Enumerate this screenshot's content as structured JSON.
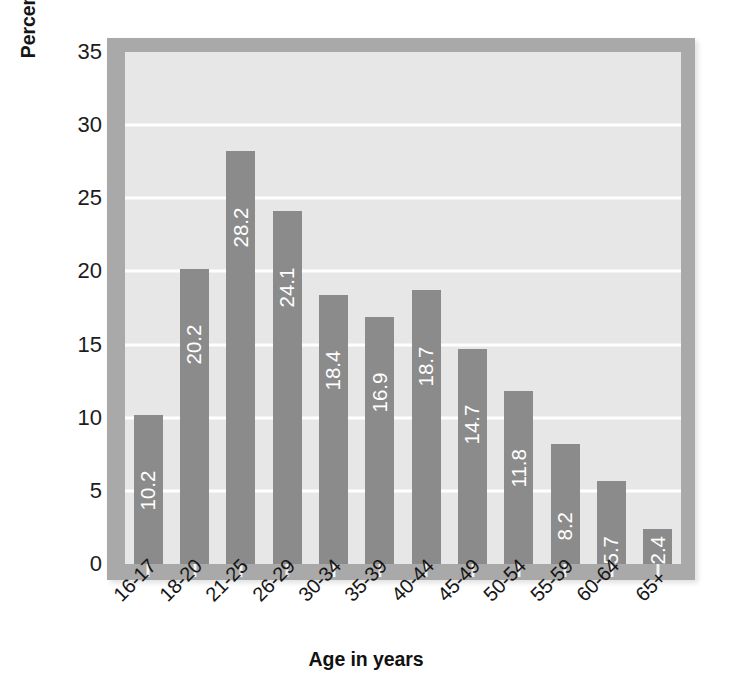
{
  "chart_data": {
    "type": "bar",
    "title": "",
    "xlabel": "Age in years",
    "ylabel": "Percent driving under the influence in past year",
    "categories": [
      "16-17",
      "18-20",
      "21-25",
      "26-29",
      "30-34",
      "35-39",
      "40-44",
      "45-49",
      "50-54",
      "55-59",
      "60-64",
      "65+"
    ],
    "values": [
      10.2,
      20.2,
      28.2,
      24.1,
      18.4,
      16.9,
      18.7,
      14.7,
      11.8,
      8.2,
      5.7,
      2.4
    ],
    "value_labels": [
      "10.2",
      "20.2",
      "28.2",
      "24.1",
      "18.4",
      "16.9",
      "18.7",
      "14.7",
      "11.8",
      "8.2",
      "5.7",
      "2.4"
    ],
    "ylim": [
      0,
      35
    ],
    "yticks": [
      0,
      5,
      10,
      15,
      20,
      25,
      30,
      35
    ],
    "ytick_labels": [
      "0",
      "5",
      "10",
      "15",
      "20",
      "25",
      "30",
      "35"
    ],
    "grid": true,
    "grid_axis": "y",
    "legend": "none",
    "bar_label_position": "inside-top",
    "bar_label_rotation": -90,
    "xtick_label_rotation": -45
  },
  "style": {
    "bar_color": "#8b8b8b",
    "plot_background": "#e7e7e7",
    "frame_color": "#a9a9a9",
    "gridline_color": "#ffffff",
    "bar_label_color": "#ffffff",
    "axis_text_color": "#1c1c1c",
    "figure_background": "#ffffff"
  }
}
